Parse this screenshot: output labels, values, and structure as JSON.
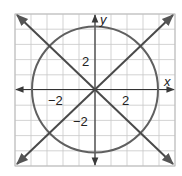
{
  "figure": {
    "type": "coordinate-graph"
  },
  "axes": {
    "x_label": "x",
    "y_label": "y",
    "x_range": [
      -5,
      5
    ],
    "y_range": [
      -5,
      5
    ],
    "grid_step": 1,
    "tick_labels": {
      "x_neg": "−2",
      "x_pos": "2",
      "y_pos": "2",
      "y_neg": "−2"
    }
  },
  "shapes": {
    "circle": {
      "center": [
        0,
        0
      ],
      "radius": 4,
      "equation": "x² + y² = 16"
    },
    "lines": [
      {
        "name": "line-y-equals-x",
        "equation": "y = x"
      },
      {
        "name": "line-y-equals-neg-x",
        "equation": "y = −x"
      }
    ]
  },
  "colors": {
    "grid": "#c8c8c8",
    "frame": "#bdbdbd",
    "axes": "#333333",
    "curves": "#606060",
    "text": "#222222"
  }
}
